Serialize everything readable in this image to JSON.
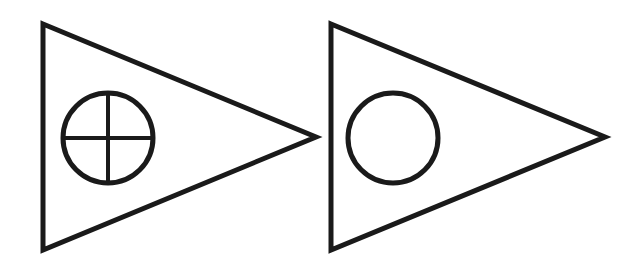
{
  "diagram": {
    "description": "Two pennant (right-pointing triangle) symbols side by side",
    "stroke_color": "#1a1a1a",
    "background": "#ffffff",
    "stroke_width": 5,
    "symbols": [
      {
        "name": "pennant-with-crossed-circle",
        "shape": "triangle-right",
        "points": [
          [
            43,
            24
          ],
          [
            316,
            137
          ],
          [
            43,
            250
          ]
        ],
        "inner": {
          "type": "circle-with-cross",
          "cx": 108,
          "cy": 138,
          "r": 45
        }
      },
      {
        "name": "pennant-with-circle",
        "shape": "triangle-right",
        "points": [
          [
            331,
            24
          ],
          [
            605,
            137
          ],
          [
            331,
            250
          ]
        ],
        "inner": {
          "type": "circle",
          "cx": 393,
          "cy": 138,
          "r": 45
        }
      }
    ]
  }
}
